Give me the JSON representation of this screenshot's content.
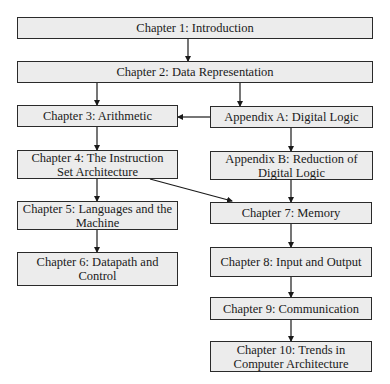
{
  "diagram": {
    "nodes": [
      {
        "id": "ch1",
        "label": "Chapter 1: Introduction"
      },
      {
        "id": "ch2",
        "label": "Chapter 2: Data Representation"
      },
      {
        "id": "ch3",
        "label": "Chapter 3: Arithmetic"
      },
      {
        "id": "appA",
        "label": "Appendix A: Digital Logic"
      },
      {
        "id": "ch4",
        "label": "Chapter 4: The Instruction Set Architecture"
      },
      {
        "id": "appB",
        "label": "Appendix B: Reduction of Digital Logic"
      },
      {
        "id": "ch5",
        "label": "Chapter 5: Languages and the Machine"
      },
      {
        "id": "ch7",
        "label": "Chapter 7: Memory"
      },
      {
        "id": "ch6",
        "label": "Chapter 6: Datapath and Control"
      },
      {
        "id": "ch8",
        "label": "Chapter 8: Input and Output"
      },
      {
        "id": "ch9",
        "label": "Chapter 9: Communication"
      },
      {
        "id": "ch10",
        "label": "Chapter 10: Trends in Computer Architecture"
      }
    ],
    "edges": [
      [
        "ch1",
        "ch2"
      ],
      [
        "ch2",
        "ch3"
      ],
      [
        "ch2",
        "appA"
      ],
      [
        "appA",
        "ch3"
      ],
      [
        "ch3",
        "ch4"
      ],
      [
        "appA",
        "appB"
      ],
      [
        "ch4",
        "ch5"
      ],
      [
        "ch4",
        "ch7"
      ],
      [
        "appB",
        "ch7"
      ],
      [
        "ch5",
        "ch6"
      ],
      [
        "ch7",
        "ch8"
      ],
      [
        "ch8",
        "ch9"
      ],
      [
        "ch9",
        "ch10"
      ]
    ],
    "colors": {
      "box_fill": "#ececec",
      "stroke": "#2a2a2a"
    }
  }
}
